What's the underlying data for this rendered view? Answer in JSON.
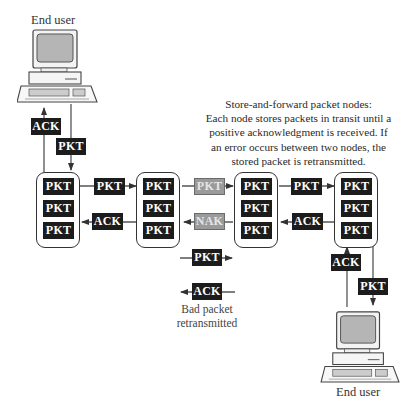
{
  "diagram": {
    "title_caption": [
      "Store-and-forward packet nodes:",
      "Each node stores packets in transit until a",
      "positive acknowledgment is received. If",
      "an error occurs between two nodes, the",
      "stored packet is retransmitted."
    ],
    "end_user_top": {
      "label": "End user",
      "icon": "desktop-computer-icon"
    },
    "end_user_bottom": {
      "label": "End user",
      "icon": "desktop-computer-icon"
    },
    "nodes": [
      {
        "id": "node-1",
        "packets": [
          "PKT",
          "PKT",
          "PKT"
        ]
      },
      {
        "id": "node-2",
        "packets": [
          "PKT",
          "PKT",
          "PKT"
        ]
      },
      {
        "id": "node-3",
        "packets": [
          "PKT",
          "PKT",
          "PKT"
        ]
      },
      {
        "id": "node-4",
        "packets": [
          "PKT",
          "PKT",
          "PKT"
        ]
      }
    ],
    "links": {
      "user_top_up": "ACK",
      "user_top_down": "PKT",
      "n1_n2_forward": "PKT",
      "n2_n1_back": "ACK",
      "n2_n3_forward": "PKT",
      "n3_n2_back": "NAK",
      "n3_n4_forward": "PKT",
      "n4_n3_back": "ACK",
      "user_bottom_up": "ACK",
      "user_bottom_down": "PKT",
      "retransmit_forward": "PKT",
      "retransmit_back": "ACK"
    },
    "retransmit_caption": [
      "Bad packet",
      "retransmitted"
    ],
    "colors": {
      "tag_dark": "#1c1c1c",
      "tag_error": "#9a9a9a",
      "line": "#444444",
      "screen": "#b5b5b5"
    }
  }
}
